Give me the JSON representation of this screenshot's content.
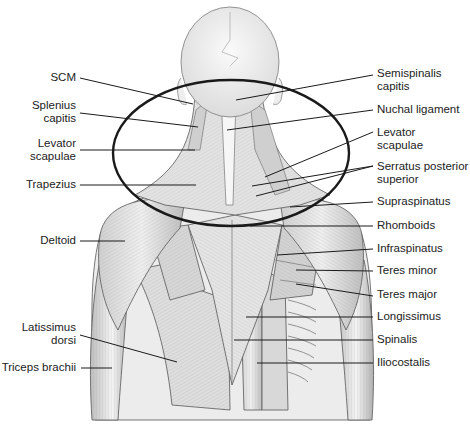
{
  "figure": {
    "colors": {
      "ink": "#1a1a1a",
      "muscle_light": "#e8e8e8",
      "muscle_mid": "#c4c4c4",
      "muscle_dark": "#8a8a8a",
      "skull": "#f2f2f2",
      "highlight_ring": "#1a1a1a"
    }
  },
  "labels_left": [
    {
      "id": "scm",
      "text": "SCM"
    },
    {
      "id": "splenius-capitis",
      "text": "Splenius\ncapitis"
    },
    {
      "id": "levator-scapulae-left",
      "text": "Levator\nscapulae"
    },
    {
      "id": "trapezius",
      "text": "Trapezius"
    },
    {
      "id": "deltoid",
      "text": "Deltoid"
    },
    {
      "id": "latissimus-dorsi",
      "text": "Latissimus\ndorsi"
    },
    {
      "id": "triceps-brachii",
      "text": "Triceps brachii"
    }
  ],
  "labels_right": [
    {
      "id": "semispinalis-capitis",
      "text": "Semispinalis\ncapitis"
    },
    {
      "id": "nuchal-ligament",
      "text": "Nuchal ligament"
    },
    {
      "id": "levator-scapulae-right",
      "text": "Levator\nscapulae"
    },
    {
      "id": "serratus-posterior-superior",
      "text": "Serratus posterior\nsuperior"
    },
    {
      "id": "supraspinatus",
      "text": "Supraspinatus"
    },
    {
      "id": "rhomboids",
      "text": "Rhomboids"
    },
    {
      "id": "infraspinatus",
      "text": "Infraspinatus"
    },
    {
      "id": "teres-minor",
      "text": "Teres minor"
    },
    {
      "id": "teres-major",
      "text": "Teres major"
    },
    {
      "id": "longissimus",
      "text": "Longissimus"
    },
    {
      "id": "spinalis",
      "text": "Spinalis"
    },
    {
      "id": "iliocostalis",
      "text": "Iliocostalis"
    }
  ]
}
